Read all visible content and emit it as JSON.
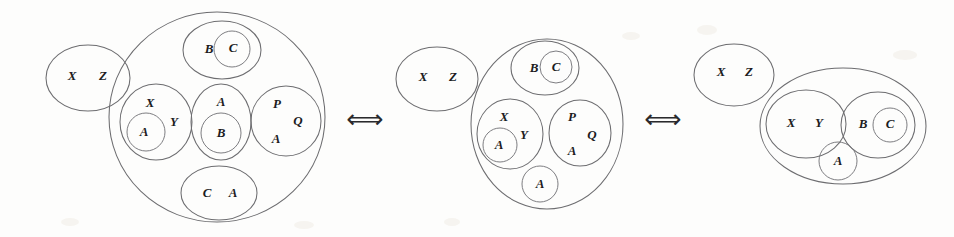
{
  "figure": {
    "background_color": "#fdfdfc",
    "stroke_color": "#6d6d70",
    "text_color": "#1c1c1e",
    "width": 954,
    "height": 237
  },
  "connectors": [
    {
      "id": "arrow-1",
      "symbol": "⟺",
      "name": "equivalence-arrow-left",
      "x": 365,
      "y": 120,
      "size": 26
    },
    {
      "id": "arrow-2",
      "symbol": "⟺",
      "name": "equivalence-arrow-right",
      "x": 663,
      "y": 120,
      "size": 26
    }
  ],
  "diagrams": [
    {
      "id": "diagram-left",
      "name": "diagram-left",
      "shapes": [
        {
          "name": "outer-ellipse-xz",
          "type": "ellipse",
          "cx": 88,
          "cy": 78,
          "rx": 42,
          "ry": 33
        },
        {
          "name": "big-circle",
          "type": "ellipse",
          "cx": 217,
          "cy": 117,
          "rx": 108,
          "ry": 105
        },
        {
          "name": "ellipse-bc",
          "type": "ellipse",
          "cx": 222,
          "cy": 50,
          "rx": 39,
          "ry": 29
        },
        {
          "name": "circle-c-inner",
          "type": "ellipse",
          "cx": 232,
          "cy": 49,
          "rx": 18,
          "ry": 18
        },
        {
          "name": "ellipse-xy",
          "type": "ellipse",
          "cx": 156,
          "cy": 122,
          "rx": 36,
          "ry": 38
        },
        {
          "name": "circle-a-in-xy",
          "type": "ellipse",
          "cx": 146,
          "cy": 132,
          "rx": 19,
          "ry": 19
        },
        {
          "name": "ellipse-ab",
          "type": "ellipse",
          "cx": 221,
          "cy": 122,
          "rx": 30,
          "ry": 38
        },
        {
          "name": "circle-b-in-ab",
          "type": "ellipse",
          "cx": 221,
          "cy": 133,
          "rx": 20,
          "ry": 20
        },
        {
          "name": "circle-pqa",
          "type": "ellipse",
          "cx": 286,
          "cy": 121,
          "rx": 35,
          "ry": 35
        },
        {
          "name": "ellipse-ca",
          "type": "ellipse",
          "cx": 219,
          "cy": 193,
          "rx": 38,
          "ry": 27
        }
      ],
      "labels": [
        {
          "name": "label-x-outer",
          "text": "X",
          "x": 72,
          "y": 77,
          "size": 13
        },
        {
          "name": "label-z-outer",
          "text": "Z",
          "x": 103,
          "y": 77,
          "size": 13
        },
        {
          "name": "label-b-top",
          "text": "B",
          "x": 209,
          "y": 50,
          "size": 13
        },
        {
          "name": "label-c-top",
          "text": "C",
          "x": 233,
          "y": 49,
          "size": 13
        },
        {
          "name": "label-x-mid",
          "text": "X",
          "x": 150,
          "y": 104,
          "size": 13
        },
        {
          "name": "label-y-mid",
          "text": "Y",
          "x": 174,
          "y": 123,
          "size": 13
        },
        {
          "name": "label-a-in-xy",
          "text": "A",
          "x": 144,
          "y": 133,
          "size": 13
        },
        {
          "name": "label-a-top-ab",
          "text": "A",
          "x": 221,
          "y": 103,
          "size": 13
        },
        {
          "name": "label-b-in-ab",
          "text": "B",
          "x": 221,
          "y": 134,
          "size": 13
        },
        {
          "name": "label-p",
          "text": "P",
          "x": 277,
          "y": 105,
          "size": 13
        },
        {
          "name": "label-q",
          "text": "Q",
          "x": 298,
          "y": 122,
          "size": 13
        },
        {
          "name": "label-a-pqa",
          "text": "A",
          "x": 276,
          "y": 140,
          "size": 13
        },
        {
          "name": "label-c-bottom",
          "text": "C",
          "x": 207,
          "y": 194,
          "size": 13
        },
        {
          "name": "label-a-bottom",
          "text": "A",
          "x": 233,
          "y": 194,
          "size": 13
        }
      ]
    },
    {
      "id": "diagram-middle",
      "name": "diagram-middle",
      "shapes": [
        {
          "name": "outer-ellipse-xz",
          "type": "ellipse",
          "cx": 437,
          "cy": 79,
          "rx": 41,
          "ry": 32
        },
        {
          "name": "big-ellipse",
          "type": "ellipse",
          "cx": 547,
          "cy": 124,
          "rx": 76,
          "ry": 85
        },
        {
          "name": "ellipse-bc",
          "type": "ellipse",
          "cx": 545,
          "cy": 68,
          "rx": 34,
          "ry": 27
        },
        {
          "name": "circle-c-inner",
          "type": "ellipse",
          "cx": 556,
          "cy": 67,
          "rx": 16,
          "ry": 16
        },
        {
          "name": "ellipse-xy",
          "type": "ellipse",
          "cx": 510,
          "cy": 134,
          "rx": 33,
          "ry": 35
        },
        {
          "name": "circle-a-in-xy",
          "type": "ellipse",
          "cx": 500,
          "cy": 145,
          "rx": 17,
          "ry": 17
        },
        {
          "name": "circle-pqa",
          "type": "ellipse",
          "cx": 580,
          "cy": 133,
          "rx": 31,
          "ry": 33
        },
        {
          "name": "circle-a-bottom",
          "type": "ellipse",
          "cx": 540,
          "cy": 184,
          "rx": 18,
          "ry": 18
        }
      ],
      "labels": [
        {
          "name": "label-x-outer",
          "text": "X",
          "x": 423,
          "y": 78,
          "size": 13
        },
        {
          "name": "label-z-outer",
          "text": "Z",
          "x": 453,
          "y": 78,
          "size": 13
        },
        {
          "name": "label-b-top",
          "text": "B",
          "x": 534,
          "y": 69,
          "size": 13
        },
        {
          "name": "label-c-top",
          "text": "C",
          "x": 556,
          "y": 68,
          "size": 13
        },
        {
          "name": "label-x-mid",
          "text": "X",
          "x": 504,
          "y": 118,
          "size": 13
        },
        {
          "name": "label-y-mid",
          "text": "Y",
          "x": 524,
          "y": 136,
          "size": 13
        },
        {
          "name": "label-a-in-xy",
          "text": "A",
          "x": 499,
          "y": 146,
          "size": 13
        },
        {
          "name": "label-p",
          "text": "P",
          "x": 572,
          "y": 118,
          "size": 13
        },
        {
          "name": "label-q",
          "text": "Q",
          "x": 592,
          "y": 136,
          "size": 13
        },
        {
          "name": "label-a-pqa",
          "text": "A",
          "x": 572,
          "y": 152,
          "size": 13
        },
        {
          "name": "label-a-bottom",
          "text": "A",
          "x": 540,
          "y": 185,
          "size": 13
        }
      ]
    },
    {
      "id": "diagram-right",
      "name": "diagram-right",
      "shapes": [
        {
          "name": "outer-ellipse-xz",
          "type": "ellipse",
          "cx": 734,
          "cy": 75,
          "rx": 40,
          "ry": 31
        },
        {
          "name": "big-ellipse",
          "type": "ellipse",
          "cx": 843,
          "cy": 126,
          "rx": 83,
          "ry": 58
        },
        {
          "name": "ellipse-xy",
          "type": "ellipse",
          "cx": 806,
          "cy": 124,
          "rx": 40,
          "ry": 34
        },
        {
          "name": "ellipse-bc",
          "type": "ellipse",
          "cx": 878,
          "cy": 125,
          "rx": 37,
          "ry": 33
        },
        {
          "name": "circle-c-inner",
          "type": "ellipse",
          "cx": 890,
          "cy": 125,
          "rx": 17,
          "ry": 17
        },
        {
          "name": "circle-a-bottom",
          "type": "ellipse",
          "cx": 838,
          "cy": 161,
          "rx": 19,
          "ry": 19
        }
      ],
      "labels": [
        {
          "name": "label-x-outer",
          "text": "X",
          "x": 721,
          "y": 73,
          "size": 13
        },
        {
          "name": "label-z-outer",
          "text": "Z",
          "x": 749,
          "y": 73,
          "size": 13
        },
        {
          "name": "label-x-xy",
          "text": "X",
          "x": 791,
          "y": 124,
          "size": 13
        },
        {
          "name": "label-y-xy",
          "text": "Y",
          "x": 819,
          "y": 124,
          "size": 13
        },
        {
          "name": "label-b-bc",
          "text": "B",
          "x": 863,
          "y": 125,
          "size": 13
        },
        {
          "name": "label-c-bc",
          "text": "C",
          "x": 890,
          "y": 125,
          "size": 13
        },
        {
          "name": "label-a-bottom",
          "text": "A",
          "x": 838,
          "y": 162,
          "size": 13
        }
      ]
    }
  ]
}
